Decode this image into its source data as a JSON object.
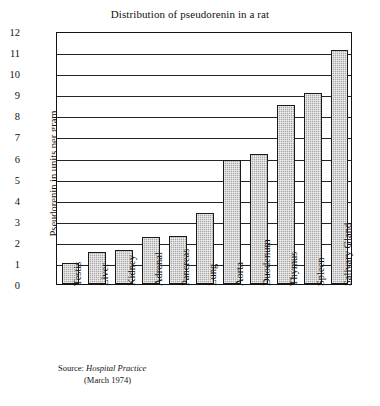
{
  "chart_data": {
    "type": "bar",
    "title": "Distribution of pseudorenin in a rat",
    "xlabel": "",
    "ylabel": "Pseudorenin in units per gram",
    "ylim": [
      0,
      12
    ],
    "ytick_step": 1,
    "grid": true,
    "legend": false,
    "categories": [
      "Testis",
      "Liver",
      "Kidney",
      "Adrenal",
      "Pancreas",
      "Lung",
      "Aorta",
      "Duodenum",
      "Thymus",
      "Spleen",
      "Salivary Gland"
    ],
    "values": [
      1.0,
      1.5,
      1.6,
      2.25,
      2.3,
      3.35,
      5.9,
      6.15,
      8.5,
      9.05,
      11.1
    ],
    "ytick_labels": [
      "0",
      "1",
      "2",
      "3",
      "4",
      "5",
      "6",
      "7",
      "8",
      "9",
      "10",
      "11",
      "12"
    ],
    "bar_color": "#a8a8a8",
    "bar_edge_color": "#1a1a1a",
    "axis_color": "#141414"
  },
  "source": {
    "label": "Source:",
    "publication": "Hospital Practice",
    "date": "(March 1974)"
  }
}
